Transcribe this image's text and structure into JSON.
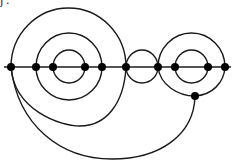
{
  "caption_fragment": "j .",
  "diagram": {
    "type": "graph",
    "colors": {
      "stroke": "#1a1a1a",
      "vertex": "#000000",
      "background": "#ffffff"
    },
    "spine": {
      "y": 67,
      "x_start": 4,
      "x_end": 231
    },
    "vertices": [
      {
        "id": "v1",
        "x": 11,
        "y": 67
      },
      {
        "id": "v2",
        "x": 36,
        "y": 67
      },
      {
        "id": "v3",
        "x": 53,
        "y": 67
      },
      {
        "id": "v4",
        "x": 85,
        "y": 67
      },
      {
        "id": "v5",
        "x": 102,
        "y": 67
      },
      {
        "id": "v6",
        "x": 126,
        "y": 67
      },
      {
        "id": "v7",
        "x": 158,
        "y": 67
      },
      {
        "id": "v8",
        "x": 175,
        "y": 67
      },
      {
        "id": "v9",
        "x": 208,
        "y": 67
      },
      {
        "id": "v10",
        "x": 225,
        "y": 67
      },
      {
        "id": "v11",
        "x": 195,
        "y": 96
      }
    ],
    "edges": [
      {
        "id": "upper-v1-v6",
        "path": "M11,67 A57.5,59 0 0,1 126,67"
      },
      {
        "id": "upper-v2-v5",
        "path": "M36,67 A33,34 0 0,1 102,67"
      },
      {
        "id": "upper-v3-v4",
        "path": "M53,67 A16,17 0 0,1 85,67"
      },
      {
        "id": "upper-v6-v7",
        "path": "M126,67 A16,17 0 0,1 158,67"
      },
      {
        "id": "upper-v7-v10",
        "path": "M158,67 A33.5,34 0 0,1 225,67"
      },
      {
        "id": "upper-v8-v9",
        "path": "M175,67 A16.5,17 0 0,1 208,67"
      },
      {
        "id": "lower-v3-v4",
        "path": "M53,67 A16,16 0 0,0 85,67"
      },
      {
        "id": "lower-v2-v5",
        "path": "M36,67 A33,33 0 0,0 102,67"
      },
      {
        "id": "lower-v1-v6",
        "path": "M11,67 C14,110 60,126 80,126 C105,126 124,105 126,67"
      },
      {
        "id": "lower-v6-v7",
        "path": "M126,67 A16,16 0 0,0 158,67"
      },
      {
        "id": "lower-v8-v9",
        "path": "M175,67 A16.5,16 0 0,0 208,67"
      },
      {
        "id": "lower-v7-v11",
        "path": "M158,67 C160,85 178,96 195,96"
      },
      {
        "id": "lower-v10-v11",
        "path": "M225,67 C224,83 212,95 195,96"
      },
      {
        "id": "lower-v1-v11",
        "path": "M11,67 C18,125 60,159 112,159 C160,159 194,135 195,96"
      }
    ]
  }
}
